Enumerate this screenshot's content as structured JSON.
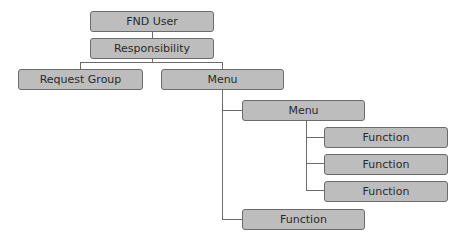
{
  "diagram": {
    "title": "",
    "colors": {
      "node_fill": "#bdbdbd",
      "node_border": "#6b6b6b",
      "text": "#2a2a2a",
      "connector": "#6b6b6b"
    },
    "nodes": [
      {
        "id": "fnd-user",
        "label": "FND User",
        "level": 0
      },
      {
        "id": "responsibility",
        "label": "Responsibility",
        "level": 1,
        "parent": "fnd-user"
      },
      {
        "id": "request-group",
        "label": "Request Group",
        "level": 2,
        "parent": "responsibility"
      },
      {
        "id": "menu-1",
        "label": "Menu",
        "level": 2,
        "parent": "responsibility"
      },
      {
        "id": "menu-2",
        "label": "Menu",
        "level": 3,
        "parent": "menu-1"
      },
      {
        "id": "function-1",
        "label": "Function",
        "level": 4,
        "parent": "menu-2"
      },
      {
        "id": "function-2",
        "label": "Function",
        "level": 4,
        "parent": "menu-2"
      },
      {
        "id": "function-3",
        "label": "Function",
        "level": 4,
        "parent": "menu-2"
      },
      {
        "id": "function-4",
        "label": "Function",
        "level": 3,
        "parent": "menu-1"
      }
    ]
  }
}
